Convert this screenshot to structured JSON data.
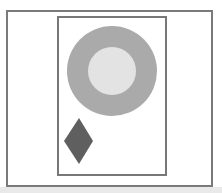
{
  "canvas": {
    "width": 222,
    "height": 193,
    "background": "#ffffff"
  },
  "frames": {
    "outer": {
      "border_color": "#7a7a7a"
    },
    "inner": {
      "border_color": "#777777"
    }
  },
  "shapes": {
    "ring": {
      "cx": 112,
      "cy": 71,
      "outer_r": 45,
      "inner_r": 24,
      "outer_color": "#aaaaaa",
      "inner_color": "#e3e3e3"
    },
    "diamond": {
      "points": "79,118 93,141 79,164 64,141",
      "color": "#5f5f5f"
    }
  },
  "bottom_strip_color": "#e9e9e9"
}
